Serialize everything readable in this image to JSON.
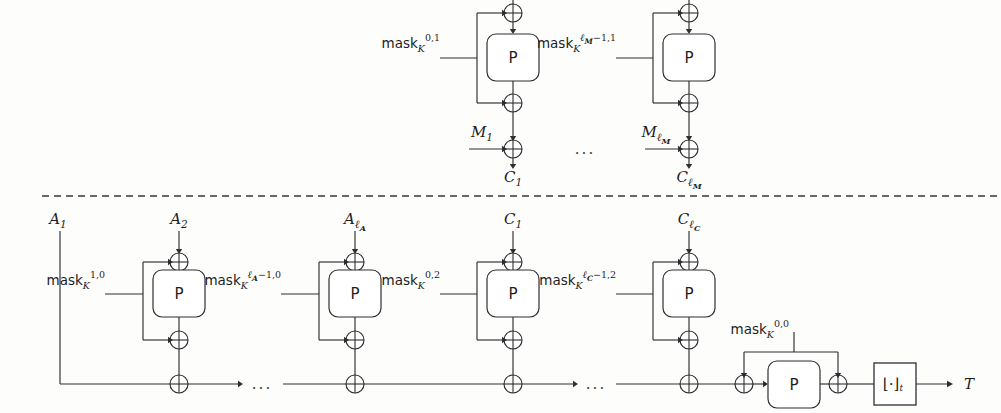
{
  "figure": {
    "separator": "dashed-horizontal-divider",
    "ellipsis": "...",
    "permutation_label": "P",
    "truncation_label": "⌊·⌋",
    "truncation_subscript": "t",
    "tag_label": "T",
    "mask_base": "mask",
    "mask_key_subscript": "K"
  },
  "encryption_row": {
    "name": "message-encryption-row",
    "blocks": [
      {
        "id": "enc-block-1",
        "mask": {
          "base": "mask",
          "sub": "K",
          "sup": "0,1"
        },
        "permutation": "P",
        "input_label": {
          "base": "M",
          "sub": "1"
        },
        "output_label": {
          "base": "C",
          "sub": "1"
        }
      },
      {
        "id": "enc-block-last",
        "mask": {
          "base": "mask",
          "sub": "K",
          "sup_bold": "ℓ",
          "sup_bold_sub": "M",
          "sup_rest": "−1,1"
        },
        "permutation": "P",
        "input_label": {
          "base": "M",
          "sub_bold": "ℓ",
          "sub_bold_sub": "M"
        },
        "output_label": {
          "base": "C",
          "sub_bold": "ℓ",
          "sub_bold_sub": "M"
        }
      }
    ]
  },
  "authentication_row": {
    "name": "authentication-row",
    "first_input": {
      "base": "A",
      "sub": "1"
    },
    "blocks": [
      {
        "id": "auth-block-a2",
        "input_label": {
          "base": "A",
          "sub": "2"
        },
        "mask": {
          "base": "mask",
          "sub": "K",
          "sup": "1,0"
        },
        "permutation": "P"
      },
      {
        "id": "auth-block-alast",
        "input_label": {
          "base": "A",
          "sub_bold": "ℓ",
          "sub_bold_sub": "A"
        },
        "mask": {
          "base": "mask",
          "sub": "K",
          "sup_bold": "ℓ",
          "sup_bold_sub": "A",
          "sup_rest": "−1,0"
        },
        "permutation": "P"
      },
      {
        "id": "auth-block-c1",
        "input_label": {
          "base": "C",
          "sub": "1"
        },
        "mask": {
          "base": "mask",
          "sub": "K",
          "sup": "0,2"
        },
        "permutation": "P"
      },
      {
        "id": "auth-block-clast",
        "input_label": {
          "base": "C",
          "sub_bold": "ℓ",
          "sub_bold_sub": "C"
        },
        "mask": {
          "base": "mask",
          "sub": "K",
          "sup_bold": "ℓ",
          "sup_bold_sub": "C",
          "sup_rest": "−1,2"
        },
        "permutation": "P"
      }
    ],
    "final_stage": {
      "id": "tag-generation-stage",
      "mask": {
        "base": "mask",
        "sub": "K",
        "sup": "0,0"
      },
      "permutation": "P",
      "truncation": "⌊·⌋",
      "truncation_sub": "t",
      "tag": "T"
    }
  },
  "colors": {
    "line": "#2e2e30",
    "text": "#1d1d1f",
    "background": "#fdfdfc",
    "box_fill": "#ffffff"
  }
}
